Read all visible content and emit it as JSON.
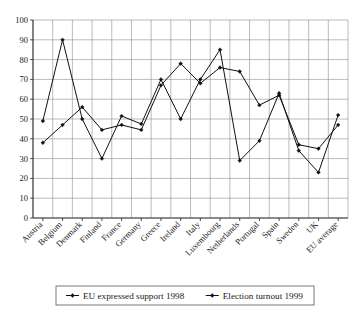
{
  "chart_data": {
    "type": "line",
    "title": "",
    "subtitle": "",
    "xlabel": "",
    "ylabel": "",
    "ylim": [
      0,
      100
    ],
    "ytick_step": 10,
    "yticks": [
      0,
      10,
      20,
      30,
      40,
      50,
      60,
      70,
      80,
      90,
      100
    ],
    "grid": true,
    "legend_position": "bottom",
    "marker": "diamond",
    "line_color": "#111111",
    "categories": [
      "Austria",
      "Belgium",
      "Denmark",
      "Finland",
      "France",
      "Germany",
      "Greece",
      "Ireland",
      "Italy",
      "Luxembourg",
      "Netherlands",
      "Portugal",
      "Spain",
      "Sweden",
      "UK",
      "EU average"
    ],
    "series": [
      {
        "name": "EU expressed support 1998",
        "values": [
          38,
          47,
          56,
          44.5,
          47,
          44.5,
          67,
          78,
          68,
          76,
          74,
          57,
          62,
          37,
          35,
          47
        ]
      },
      {
        "name": "Election turnout 1999",
        "values": [
          49,
          90,
          50,
          30,
          51.5,
          47.5,
          70,
          50,
          70,
          85,
          29,
          39,
          63,
          34,
          23,
          52
        ]
      }
    ]
  },
  "legend": {
    "entries": [
      {
        "label": "EU expressed support 1998"
      },
      {
        "label": "Election turnout 1999"
      }
    ]
  }
}
